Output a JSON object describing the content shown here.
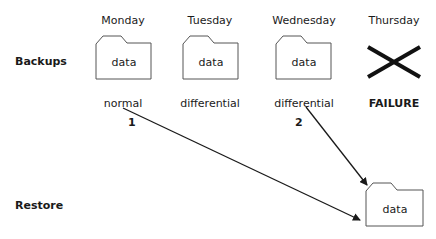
{
  "diagram": {
    "row_labels": {
      "backups": "Backups",
      "restore": "Restore"
    },
    "days": [
      {
        "name": "Monday",
        "type": "normal",
        "folder_label": "data",
        "status": "ok"
      },
      {
        "name": "Tuesday",
        "type": "differential",
        "folder_label": "data",
        "status": "ok"
      },
      {
        "name": "Wednesday",
        "type": "differential",
        "folder_label": "data",
        "status": "ok"
      },
      {
        "name": "Thursday",
        "type": "FAILURE",
        "folder_label": "",
        "status": "failed"
      }
    ],
    "restore": {
      "folder_label": "data"
    },
    "restore_steps": [
      {
        "order": "1",
        "from": "Monday",
        "to": "Restore"
      },
      {
        "order": "2",
        "from": "Wednesday",
        "to": "Restore"
      }
    ],
    "colors": {
      "stroke": "#1a1a1a",
      "background": "#ffffff"
    }
  }
}
